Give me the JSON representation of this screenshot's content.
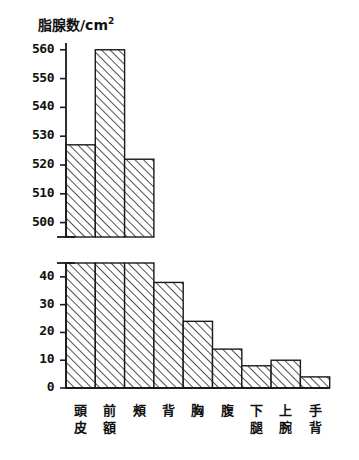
{
  "chart_data": {
    "type": "bar",
    "title": "脂腺数/cm2",
    "title_base": "脂腺数/cm",
    "title_sup": "2",
    "xlabel": "",
    "ylabel": "脂腺数/cm2",
    "grid": false,
    "legend": false,
    "broken_axis": true,
    "axis_note": "y-axis has a break between 45 and 500",
    "categories": [
      "頭皮",
      "前額",
      "頰",
      "背",
      "胸",
      "腹",
      "下腿",
      "上腕",
      "手背"
    ],
    "category_lines": [
      [
        "頭",
        "皮"
      ],
      [
        "前",
        "額"
      ],
      [
        "頰",
        ""
      ],
      [
        "背",
        ""
      ],
      [
        "胸",
        ""
      ],
      [
        "腹",
        ""
      ],
      [
        "下",
        "腿"
      ],
      [
        "上",
        "腕"
      ],
      [
        "手",
        "背"
      ]
    ],
    "values": [
      527,
      560,
      522,
      38,
      24,
      14,
      8,
      10,
      4
    ],
    "lower_panel": {
      "ylim": [
        0,
        45
      ],
      "ticks": [
        0,
        10,
        20,
        30,
        40
      ],
      "tick_labels": [
        "0",
        "10",
        "20",
        "30",
        "40"
      ]
    },
    "upper_panel": {
      "ylim": [
        495,
        562
      ],
      "ticks": [
        500,
        510,
        520,
        530,
        540,
        550,
        560
      ],
      "tick_labels": [
        "500",
        "510",
        "520",
        "530",
        "540",
        "550",
        "560"
      ]
    },
    "bar_style": {
      "fill": "diagonal-hatch",
      "edge_color": "#1a1a1a",
      "face_color": "#ffffff",
      "hatch_color": "#2b2b2b"
    }
  }
}
